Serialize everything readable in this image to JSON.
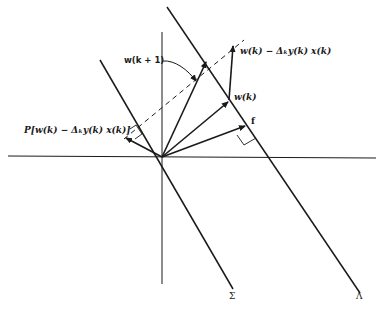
{
  "diagram": {
    "labels": {
      "w_k_plus_1": "w(k + 1)",
      "w_k_minus": "w(k) − Δₖy(k)  x(k)",
      "w_k": "w(k)",
      "f": "f",
      "projection": "P[w(k) − Δₖy(k)  x(k)]",
      "sigma": "Σ",
      "lambda": "Λ"
    },
    "colors": {
      "stroke": "#1a1a1a",
      "background": "#ffffff"
    }
  }
}
